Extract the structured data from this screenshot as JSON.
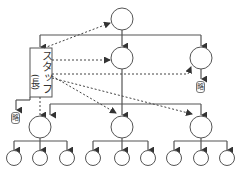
{
  "diagram": {
    "type": "line-and-staff organization chart",
    "staff": {
      "label": "スタッフ",
      "sub_label": "(長)"
    },
    "omission_labels": [
      "略",
      "略"
    ],
    "colors": {
      "line": "#555555",
      "background": "#ffffff"
    },
    "nodes": {
      "top": 1,
      "level2": 2,
      "level3": 3,
      "level4": 9
    }
  }
}
